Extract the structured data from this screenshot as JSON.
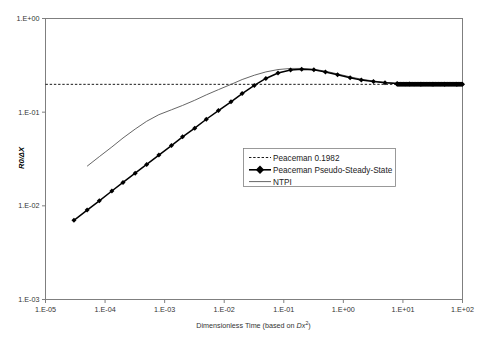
{
  "chart_data": {
    "type": "line",
    "title": "",
    "xlabel": "Dimensionless Time (based on Dx²)",
    "xlabel_parts": {
      "pre": "Dimensionless Time (based on ",
      "italic": "Dx",
      "sup": "2",
      "post": ")"
    },
    "ylabel": "R0/ΔX",
    "ylabel_parts": {
      "main": "R0/",
      "delta": "Δ",
      "tail": "X"
    },
    "xscale": "log",
    "yscale": "log",
    "xlim": [
      1e-05,
      100.0
    ],
    "ylim": [
      0.001,
      1.0
    ],
    "grid": false,
    "legend_position": "center-right-lower",
    "xtick_labels": [
      "1.E-05",
      "1.E-04",
      "1.E-03",
      "1.E-02",
      "1.E-01",
      "1.E+00",
      "1.E+01",
      "1.E+02"
    ],
    "xtick_values": [
      1e-05,
      0.0001,
      0.001,
      0.01,
      0.1,
      1.0,
      10.0,
      100.0
    ],
    "ytick_labels": [
      "1.E+00",
      "1.E-01",
      "1.E-02",
      "1.E-03"
    ],
    "ytick_values": [
      1,
      0.1,
      0.01,
      0.001
    ],
    "series": [
      {
        "name": "Peaceman 0.1982",
        "style": "dashed",
        "constant": 0.1982,
        "x": [
          1e-05,
          100.0
        ],
        "values": [
          0.1982,
          0.1982
        ]
      },
      {
        "name": "Peaceman Pseudo-Steady-State",
        "style": "line-markers",
        "marker": "diamond",
        "x": [
          3e-05,
          5e-05,
          8e-05,
          0.00013,
          0.0002,
          0.00032,
          0.0005,
          0.0008,
          0.0013,
          0.002,
          0.0032,
          0.005,
          0.008,
          0.013,
          0.02,
          0.032,
          0.05,
          0.08,
          0.13,
          0.2,
          0.32,
          0.5,
          0.8,
          1.3,
          2.0,
          3.2,
          5.0,
          8.0,
          13.0,
          20.0,
          32.0,
          50.0,
          80.0,
          100.0
        ],
        "values": [
          0.007,
          0.009,
          0.0113,
          0.0144,
          0.0178,
          0.0223,
          0.0277,
          0.0348,
          0.044,
          0.0545,
          0.0675,
          0.084,
          0.104,
          0.129,
          0.158,
          0.193,
          0.229,
          0.262,
          0.282,
          0.288,
          0.283,
          0.269,
          0.251,
          0.233,
          0.221,
          0.212,
          0.206,
          0.202,
          0.2,
          0.1992,
          0.1986,
          0.1983,
          0.1982,
          0.1982
        ]
      },
      {
        "name": "NTPI",
        "style": "line",
        "x": [
          5e-05,
          8e-05,
          0.00013,
          0.0002,
          0.00032,
          0.0005,
          0.0008,
          0.0013,
          0.002,
          0.0032,
          0.005,
          0.008,
          0.013,
          0.02,
          0.032,
          0.05,
          0.08,
          0.13,
          0.2,
          0.32,
          0.5,
          0.8,
          1.3,
          2.0,
          3.2,
          5.0,
          8.0,
          13.0,
          20.0,
          32.0,
          50.0,
          80.0,
          100.0
        ],
        "values": [
          0.0265,
          0.0335,
          0.0425,
          0.053,
          0.066,
          0.08,
          0.094,
          0.106,
          0.118,
          0.134,
          0.153,
          0.174,
          0.198,
          0.223,
          0.248,
          0.269,
          0.285,
          0.293,
          0.293,
          0.287,
          0.274,
          0.256,
          0.238,
          0.225,
          0.215,
          0.208,
          0.203,
          0.2005,
          0.1995,
          0.1988,
          0.1984,
          0.1982,
          0.1982
        ]
      }
    ]
  },
  "legend": {
    "items": [
      {
        "label": "Peaceman 0.1982",
        "swatch": "dashed-line"
      },
      {
        "label": "Peaceman Pseudo-Steady-State",
        "swatch": "line-diamond"
      },
      {
        "label": "NTPI",
        "swatch": "solid-line"
      }
    ]
  },
  "colors": {
    "axis": "#7f7f7f",
    "pss": "#000000",
    "ntpi": "#555555",
    "peaceman": "#000000",
    "background": "#ffffff"
  }
}
